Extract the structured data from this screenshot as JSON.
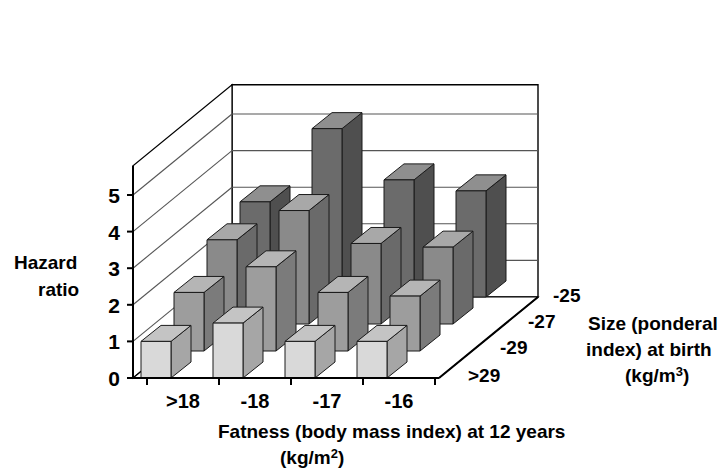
{
  "chart_data": {
    "type": "bar",
    "subtype": "3d-grouped-bar",
    "title": "",
    "xlabel": "Fatness (body mass index) at 12 years (kg/m2)",
    "ylabel": "Hazard ratio",
    "zlabel": "Size (ponderal index) at birth (kg/m3)",
    "categories": [
      ">18",
      "-18",
      "-17",
      "-16"
    ],
    "depth_categories": [
      "-25",
      "-27",
      "-29",
      ">29"
    ],
    "depth_order_front_to_back": [
      ">29",
      "-29",
      "-27",
      "-25"
    ],
    "ylim": [
      0,
      5.8
    ],
    "yticks": [
      0,
      1,
      2,
      3,
      4,
      5
    ],
    "grid": true,
    "legend": "none",
    "series": [
      {
        "name": ">29",
        "values": [
          1.0,
          1.5,
          1.0,
          1.0
        ]
      },
      {
        "name": "-29",
        "values": [
          1.6,
          2.3,
          1.6,
          1.5
        ]
      },
      {
        "name": "-27",
        "values": [
          2.3,
          3.1,
          2.2,
          2.1
        ]
      },
      {
        "name": "-25",
        "values": [
          2.6,
          4.6,
          3.2,
          2.9
        ]
      }
    ],
    "values_by_category": {
      ">18": {
        ">29": 1.0,
        "-29": 1.6,
        "-27": 2.3,
        "-25": 2.6
      },
      "-18": {
        ">29": 1.5,
        "-29": 2.3,
        "-27": 3.1,
        "-25": 4.6
      },
      "-17": {
        ">29": 1.0,
        "-29": 1.6,
        "-27": 2.2,
        "-25": 3.2
      },
      "-16": {
        ">29": 1.0,
        "-29": 1.5,
        "-27": 2.1,
        "-25": 2.9
      }
    }
  },
  "axes": {
    "y": {
      "label_line1": "Hazard",
      "label_line2": "ratio",
      "ticks": [
        "5",
        "4",
        "3",
        "2",
        "1",
        "0"
      ],
      "tick_values": [
        5,
        4,
        3,
        2,
        1,
        0
      ]
    },
    "x": {
      "tick_labels": [
        ">18",
        "-18",
        "-17",
        "-16"
      ],
      "title_line1": "Fatness (body mass index) at 12 years",
      "title_line2_prefix": "(kg/m",
      "title_line2_sup": "2",
      "title_line2_suffix": ")"
    },
    "z": {
      "tick_labels": [
        "-25",
        "-27",
        "-29",
        ">29"
      ],
      "title_line1": "Size (ponderal",
      "title_line2": "index) at birth",
      "title_line3_prefix": "(kg/m",
      "title_line3_sup": "3",
      "title_line3_suffix": ")"
    }
  },
  "colors": {
    "background": "#ffffff",
    "axis_line": "#000000",
    "grid_line": "#555555",
    "floor_fill": "#ffffff",
    "bar_front_light": "#d9d9d9",
    "bar_side_light": "#a6a6a6",
    "bar_top_light": "#c4c4c4",
    "bar_front_mid": "#9d9d9d",
    "bar_side_mid": "#7b7b7b",
    "bar_top_mid": "#b5b5b5",
    "bar_front_dark": "#8a8a8a",
    "bar_side_dark": "#6a6a6a",
    "bar_top_dark": "#a8a8a8",
    "bar_front_darkest": "#6b6b6b",
    "bar_side_darkest": "#4f4f4f",
    "bar_top_darkest": "#8f8f8f",
    "outline": "#1a1a1a"
  }
}
